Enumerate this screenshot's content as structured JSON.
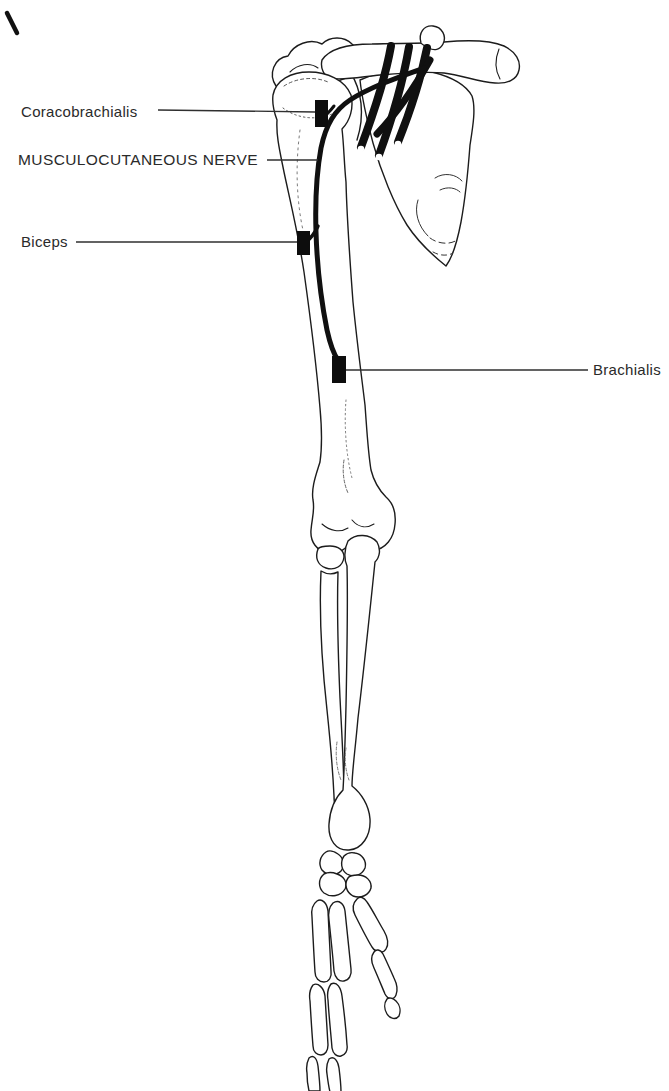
{
  "diagram": {
    "background_color": "#ffffff",
    "ink_color": "#1c1c1c",
    "labels": {
      "coracobrachialis": "Coracobrachialis",
      "musculocutaneous_nerve": "MUSCULOCUTANEOUS NERVE",
      "biceps": "Biceps",
      "brachialis": "Brachialis"
    },
    "markers": [
      {
        "name": "coracobrachialis-motor-point"
      },
      {
        "name": "biceps-motor-point"
      },
      {
        "name": "brachialis-motor-point"
      }
    ]
  }
}
